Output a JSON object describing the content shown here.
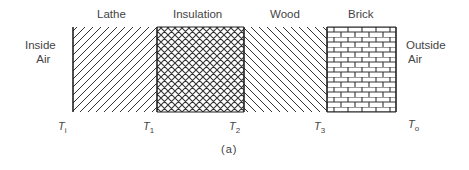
{
  "figure": {
    "caption": "(a)",
    "left_label": [
      "Inside",
      "Air"
    ],
    "right_label": [
      "Outside",
      "Air"
    ],
    "layers": [
      {
        "name": "Lathe",
        "pattern": "diagonal-forward"
      },
      {
        "name": "Insulation",
        "pattern": "crosshatch"
      },
      {
        "name": "Wood",
        "pattern": "diagonal-backward"
      },
      {
        "name": "Brick",
        "pattern": "brick"
      }
    ],
    "temperatures": [
      {
        "symbol": "T",
        "sub": "i"
      },
      {
        "symbol": "T",
        "sub": "1"
      },
      {
        "symbol": "T",
        "sub": "2"
      },
      {
        "symbol": "T",
        "sub": "3"
      },
      {
        "symbol": "T",
        "sub": "o"
      }
    ]
  }
}
